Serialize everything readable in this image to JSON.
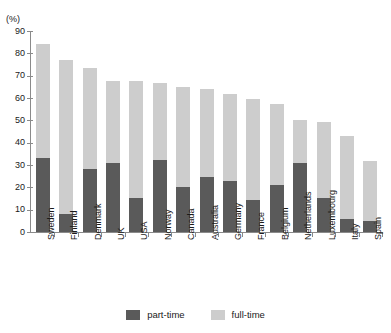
{
  "top_remnant_text": "",
  "axis_unit_label": "(%)",
  "legend": {
    "items": [
      {
        "label": "part-time",
        "color": "#5a5a5a",
        "swatch_name": "legend-swatch-part-time"
      },
      {
        "label": "full-time",
        "color": "#cdcdcd",
        "swatch_name": "legend-swatch-full-time"
      }
    ]
  },
  "chart_data": {
    "type": "bar",
    "stacked": true,
    "title": "",
    "subtitle": "",
    "xlabel": "",
    "ylabel": "(%)",
    "ylim": [
      0,
      90
    ],
    "ytick_labels": [
      "0",
      "10",
      "20",
      "30",
      "40",
      "50",
      "60",
      "70",
      "80",
      "90"
    ],
    "ytick_values": [
      0,
      10,
      20,
      30,
      40,
      50,
      60,
      70,
      80,
      90
    ],
    "grid": false,
    "legend_position": "bottom-center",
    "categories": [
      "Sweden",
      "Finland",
      "Denmark",
      "UK",
      "USA",
      "Norway",
      "Canada",
      "Australia",
      "Germany",
      "France",
      "Belgium",
      "Netherlands",
      "Luxembourg",
      "Italy",
      "Spain"
    ],
    "series": [
      {
        "name": "part-time",
        "color": "#5a5a5a",
        "values": [
          33.2,
          8.2,
          28.0,
          31.0,
          15.4,
          32.2,
          20.3,
          24.7,
          22.7,
          14.4,
          21.0,
          31.0,
          15.4,
          5.6,
          5.0
        ]
      },
      {
        "name": "full-time",
        "color": "#cdcdcd",
        "values": [
          50.8,
          69.0,
          45.3,
          36.8,
          52.4,
          34.7,
          44.8,
          39.2,
          38.9,
          45.0,
          36.2,
          19.3,
          33.8,
          37.3,
          26.6
        ]
      }
    ],
    "totals": [
      84.0,
      77.2,
      73.3,
      67.8,
      67.8,
      66.9,
      65.1,
      63.9,
      61.6,
      59.4,
      57.2,
      50.3,
      49.2,
      42.9,
      31.6
    ]
  }
}
